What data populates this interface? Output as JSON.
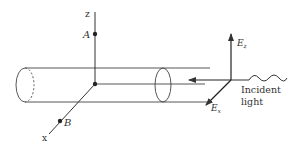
{
  "diagram": {
    "axes": {
      "z_label": "z",
      "x_label": "x"
    },
    "points": {
      "A": "A",
      "B": "B"
    },
    "field": {
      "Ez_main": "E",
      "Ez_sub": "z",
      "Ex_main": "E",
      "Ex_sub": "x"
    },
    "incident": {
      "line1": "Incident",
      "line2": "light"
    },
    "colors": {
      "stroke": "#333333",
      "background": "#ffffff"
    }
  }
}
